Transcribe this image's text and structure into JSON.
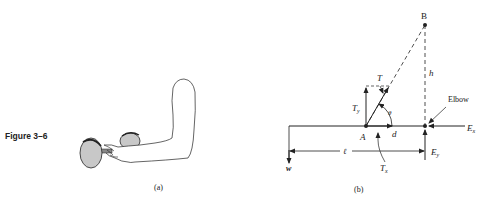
{
  "figure": {
    "number_label": "Figure 3–6",
    "panel_a": {
      "caption": "(a)",
      "description": "Forearm holding a dumbbell, elbow bent with upper arm vertical"
    },
    "panel_b": {
      "caption": "(b)",
      "labels": {
        "point_A": "A",
        "point_B": "B",
        "tension": "T",
        "tension_y": "T",
        "tension_y_sub": "y",
        "tension_x": "T",
        "tension_x_sub": "x",
        "angle": "θ",
        "distance_d": "d",
        "height_h": "h",
        "length_l": "ℓ",
        "weight": "w",
        "elbow": "Elbow",
        "elbow_x": "E",
        "elbow_x_sub": "x",
        "elbow_y": "E",
        "elbow_y_sub": "y"
      }
    }
  },
  "colors": {
    "line": "#222222",
    "dumbbell_fill": "#c8c8c8",
    "background": "#ffffff"
  }
}
